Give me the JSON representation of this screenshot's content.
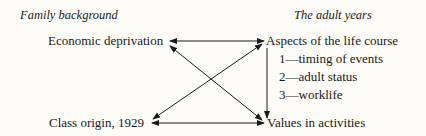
{
  "headers": {
    "left": "Family background",
    "right": "The adult years"
  },
  "nodes": {
    "economic_deprivation": "Economic deprivation",
    "class_origin": "Class origin, 1929",
    "aspects": "Aspects of the life course",
    "values": "Values in activities"
  },
  "aspects_list": [
    "1—timing of events",
    "2—adult status",
    "3—worklife"
  ],
  "edges": [
    {
      "from": "economic_deprivation",
      "to": "aspects",
      "type": "bidirectional"
    },
    {
      "from": "class_origin",
      "to": "values",
      "type": "bidirectional"
    },
    {
      "from": "economic_deprivation",
      "to": "values",
      "type": "bidirectional"
    },
    {
      "from": "class_origin",
      "to": "aspects",
      "type": "bidirectional"
    },
    {
      "from": "aspects",
      "to": "values",
      "type": "directed"
    }
  ]
}
